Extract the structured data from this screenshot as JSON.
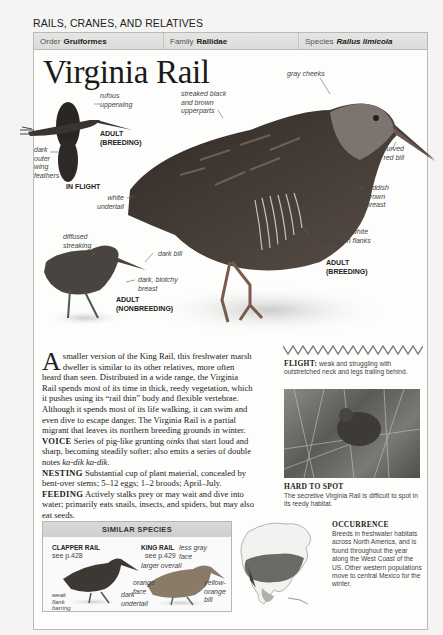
{
  "section_title": "RAILS, CRANES, AND RELATIVES",
  "taxonomy": {
    "order_label": "Order",
    "order_value": "Gruiformes",
    "family_label": "Family",
    "family_value": "Rallidae",
    "species_label": "Species",
    "species_value": "Rallus limicola"
  },
  "title": "Virginia Rail",
  "illustrations": {
    "flight": {
      "labels": [
        "rufous",
        "upperwing",
        "dark",
        "outer",
        "wing",
        "feathers"
      ],
      "caption_line1": "ADULT",
      "caption_line2": "(BREEDING)",
      "caption_bottom": "IN FLIGHT"
    },
    "breeding": {
      "streaked": [
        "streaked black",
        "and brown",
        "upperparts"
      ],
      "gray_cheeks": "gray cheeks",
      "curved_bill": [
        "curved",
        "red bill"
      ],
      "white_undertail": [
        "white",
        "undertail"
      ],
      "breast": [
        "reddish",
        "brown",
        "breast"
      ],
      "barring": [
        "black-and-white",
        "barring on flanks"
      ],
      "legs": [
        "reddish",
        "legs and",
        "toes"
      ],
      "caption_line1": "ADULT",
      "caption_line2": "(BREEDING)"
    },
    "nonbreeding": {
      "diffused": [
        "diffused",
        "streaking"
      ],
      "dark_bill": "dark bill",
      "blotchy": [
        "dark, blotchy",
        "breast"
      ],
      "caption_line1": "ADULT",
      "caption_line2": "(NONBREEDING)"
    }
  },
  "description": {
    "drop_cap": "A",
    "intro": " smaller version of the King Rail, this freshwater marsh dweller is similar to its other relatives, more often heard than seen. Distributed in a wide range, the Virginia Rail spends most of its time in thick, reedy vegetation, which it pushes using its “rail thin” body and flexible vertebrae. Although it spends most of its life walking, it can swim and even dive to escape danger. The Virginia Rail is a partial migrant that leaves its northern breeding grounds in winter.",
    "voice_label": "VOICE",
    "voice_text_1": " Series of pig-like grunting ",
    "voice_italic_1": "oinks",
    "voice_text_2": " that start loud and sharp, becoming steadily softer; also emits a series of double notes ",
    "voice_italic_2": "ka-dik ka-dik",
    "voice_text_3": ".",
    "nesting_label": "NESTING",
    "nesting_text": " Substantial cup of plant material, concealed by bent-over stems; 5–12 eggs; 1–2 broods; April–July.",
    "feeding_label": "FEEDING",
    "feeding_text": " Actively stalks prey or may wait and dive into water; primarily eats snails, insects, and spiders, but may also eat seeds."
  },
  "flight": {
    "label": "FLIGHT:",
    "text": " weak and struggling with outstretched neck and legs trailing behind."
  },
  "hard_to_spot": {
    "title": "HARD TO SPOT",
    "text": "The secretive Virginia Rail is difficult to spot in its reedy habitat."
  },
  "similar_species": {
    "header": "SIMILAR SPECIES",
    "clapper": {
      "name": "CLAPPER RAIL",
      "ref": "see p.428",
      "labels": {
        "orange_face": [
          "orange",
          "face"
        ],
        "weak_flank": [
          "weak",
          "flank",
          "barring"
        ]
      }
    },
    "king": {
      "name": "KING RAIL",
      "ref": "see p.429",
      "labels": {
        "less_gray": [
          "less gray",
          "face"
        ],
        "larger": "larger overall",
        "yellow_bill": [
          "yellow-",
          "orange",
          "bill"
        ],
        "dark_undertail": [
          "dark",
          "undertail"
        ]
      }
    }
  },
  "occurrence": {
    "title": "OCCURRENCE",
    "text": "Breeds in freshwater habitats across North America, and is found throughout the year along the West Coast of the US. Other western populations move to central Mexico for the winter."
  }
}
